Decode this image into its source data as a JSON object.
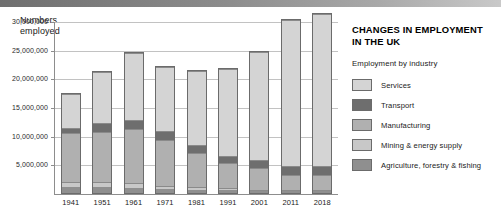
{
  "header": {
    "decor_bar": "gradient-rule"
  },
  "info": {
    "title": "CHANGES IN EMPLOYMENT\nIN THE UK",
    "legend_heading": "Employment by industry"
  },
  "colors": {
    "services": "#d4d4d4",
    "transport": "#6e6e6e",
    "manufacturing": "#b0b0b0",
    "mining": "#c8c8c8",
    "agriculture": "#8f8f8f",
    "axis": "#8d8d8d",
    "grid": "#c2c2c2",
    "bar_outline": "#6b6b6b"
  },
  "chart_data": {
    "type": "bar",
    "subtype": "stacked-column",
    "title": "CHANGES IN EMPLOYMENT IN THE UK",
    "xlabel": "",
    "ylabel": "Numbers\nemployed",
    "ylim": [
      0,
      30000000
    ],
    "yticks": [
      5000000,
      10000000,
      15000000,
      20000000,
      25000000,
      30000000
    ],
    "ytick_labels": [
      "5,000,000",
      "10,000,000",
      "15,000,000",
      "20,000,000",
      "25,000,000",
      "30,000,000"
    ],
    "grid": true,
    "legend_position": "right",
    "categories": [
      "1941",
      "1951",
      "1961",
      "1971",
      "1981",
      "1991",
      "2001",
      "2011",
      "2018"
    ],
    "series": [
      {
        "name": "Agriculture, forestry & fishing",
        "color": "#8f8f8f",
        "values": [
          1100000,
          1000000,
          900000,
          700000,
          600000,
          500000,
          400000,
          400000,
          400000
        ]
      },
      {
        "name": "Mining & energy supply",
        "color": "#c8c8c8",
        "values": [
          900000,
          900000,
          800000,
          600000,
          500000,
          300000,
          200000,
          200000,
          200000
        ]
      },
      {
        "name": "Manufacturing",
        "color": "#b0b0b0",
        "values": [
          8600000,
          9000000,
          9700000,
          8000000,
          6000000,
          4500000,
          3800000,
          2600000,
          2600000
        ]
      },
      {
        "name": "Transport",
        "color": "#6e6e6e",
        "values": [
          1000000,
          1500000,
          1600000,
          1600000,
          1400000,
          1300000,
          1400000,
          1500000,
          1600000
        ]
      },
      {
        "name": "Services",
        "color": "#d4d4d4",
        "values": [
          6000000,
          9000000,
          11800000,
          11500000,
          13100000,
          15400000,
          19200000,
          25800000,
          26700000
        ]
      }
    ],
    "totals": [
      17600000,
      21400000,
      24800000,
      22400000,
      21600000,
      22000000,
      25000000,
      30500000,
      31500000
    ]
  },
  "legend": {
    "items": [
      {
        "label": "Services",
        "color": "#d4d4d4"
      },
      {
        "label": "Transport",
        "color": "#6e6e6e"
      },
      {
        "label": "Manufacturing",
        "color": "#b0b0b0"
      },
      {
        "label": "Mining & energy supply",
        "color": "#c8c8c8"
      },
      {
        "label": "Agriculture, forestry & fishing",
        "color": "#8f8f8f"
      }
    ]
  }
}
